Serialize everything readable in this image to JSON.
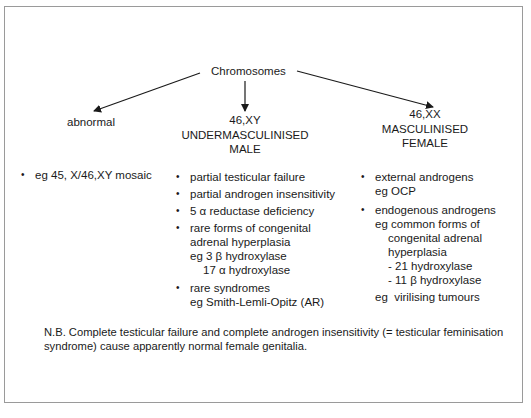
{
  "diagram": {
    "root": "Chromosomes",
    "branches": [
      {
        "title_lines": [
          "abnormal"
        ],
        "items": [
          {
            "lines": [
              "eg 45, X/46,XY mosaic"
            ]
          }
        ]
      },
      {
        "title_lines": [
          "46,XY",
          "UNDERMASCULINISED",
          "MALE"
        ],
        "items": [
          {
            "lines": [
              "partial testicular failure"
            ]
          },
          {
            "lines": [
              "partial androgen insensitivity"
            ]
          },
          {
            "lines": [
              "5 α reductase deficiency"
            ]
          },
          {
            "lines": [
              "rare forms of congenital",
              "adrenal hyperplasia",
              "eg 3 β hydroxylase",
              "17 α hydroxylase"
            ]
          },
          {
            "lines": [
              "rare syndromes",
              "eg Smith-Lemli-Opitz (AR)"
            ]
          }
        ]
      },
      {
        "title_lines": [
          "46,XX",
          "MASCULINISED",
          "FEMALE"
        ],
        "items": [
          {
            "lines": [
              "external androgens",
              "eg OCP"
            ]
          },
          {
            "lines": [
              "endogenous androgens",
              "eg common forms of",
              "congenital adrenal",
              "hyperplasia",
              "- 21 hydroxylase",
              "- 11 β hydroxylase"
            ]
          }
        ],
        "footer": "eg  virilising tumours"
      }
    ],
    "note_lines": [
      "N.B. Complete testicular failure and complete androgen insensitivity (= testicular feminisation",
      "syndrome) cause apparently normal female genitalia."
    ],
    "colors": {
      "frame": "#9a9a9a",
      "text": "#1a1a1a",
      "arrow": "#1a1a1a"
    }
  }
}
